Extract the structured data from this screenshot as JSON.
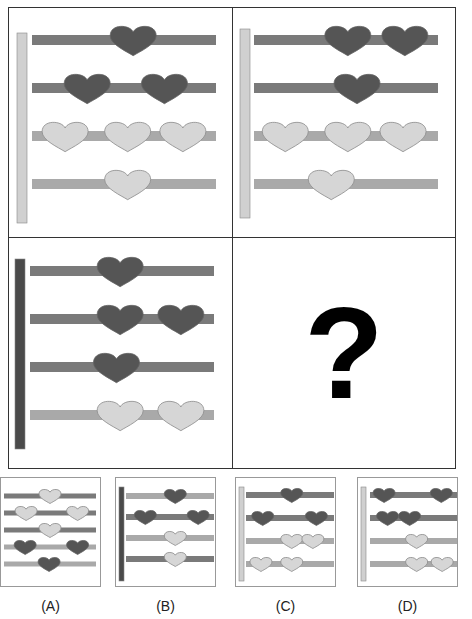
{
  "colors": {
    "dark": "#555555",
    "dark_bar": "#7a7a7a",
    "light": "#d6d6d6",
    "light_bar": "#a9a9a9",
    "light_stroke": "#8a8a8a",
    "dark_pole": "#4a4a4a",
    "light_pole": "#d0d0d0"
  },
  "puzzle": {
    "cells": [
      {
        "name": "cell-top-left",
        "pole": "light",
        "rows": [
          {
            "bar": "dark",
            "hearts": [
              {
                "c": "dark",
                "x": 0.55
              }
            ]
          },
          {
            "bar": "dark",
            "hearts": [
              {
                "c": "dark",
                "x": 0.3
              },
              {
                "c": "dark",
                "x": 0.72
              }
            ]
          },
          {
            "bar": "light",
            "hearts": [
              {
                "c": "light",
                "x": 0.18
              },
              {
                "c": "light",
                "x": 0.52
              },
              {
                "c": "light",
                "x": 0.82
              }
            ]
          },
          {
            "bar": "light",
            "hearts": [
              {
                "c": "light",
                "x": 0.52
              }
            ]
          }
        ]
      },
      {
        "name": "cell-top-right",
        "pole": "light",
        "rows": [
          {
            "bar": "dark",
            "hearts": [
              {
                "c": "dark",
                "x": 0.51
              },
              {
                "c": "dark",
                "x": 0.82
              }
            ]
          },
          {
            "bar": "dark",
            "hearts": [
              {
                "c": "dark",
                "x": 0.56
              }
            ]
          },
          {
            "bar": "light",
            "hearts": [
              {
                "c": "light",
                "x": 0.17
              },
              {
                "c": "light",
                "x": 0.51
              },
              {
                "c": "light",
                "x": 0.81
              }
            ]
          },
          {
            "bar": "light",
            "hearts": [
              {
                "c": "light",
                "x": 0.42
              }
            ]
          }
        ]
      },
      {
        "name": "cell-bottom-left",
        "pole": "dark",
        "rows": [
          {
            "bar": "dark",
            "hearts": [
              {
                "c": "dark",
                "x": 0.49
              }
            ]
          },
          {
            "bar": "dark",
            "hearts": [
              {
                "c": "dark",
                "x": 0.49
              },
              {
                "c": "dark",
                "x": 0.82
              }
            ]
          },
          {
            "bar": "dark",
            "hearts": [
              {
                "c": "dark",
                "x": 0.47
              }
            ]
          },
          {
            "bar": "light",
            "hearts": [
              {
                "c": "light",
                "x": 0.49
              },
              {
                "c": "light",
                "x": 0.82
              }
            ]
          }
        ]
      }
    ],
    "question_mark": "?"
  },
  "options": [
    {
      "label": "(A)",
      "pole": null,
      "rows": [
        {
          "bar": "dark",
          "hearts": [
            {
              "c": "light",
              "x": 0.5
            }
          ]
        },
        {
          "bar": "dark",
          "hearts": [
            {
              "c": "light",
              "x": 0.24
            },
            {
              "c": "light",
              "x": 0.8
            }
          ]
        },
        {
          "bar": "dark",
          "hearts": [
            {
              "c": "light",
              "x": 0.5
            }
          ]
        },
        {
          "bar": "light",
          "hearts": [
            {
              "c": "dark",
              "x": 0.23
            },
            {
              "c": "dark",
              "x": 0.8
            }
          ]
        },
        {
          "bar": "light",
          "hearts": [
            {
              "c": "dark",
              "x": 0.49
            }
          ]
        }
      ]
    },
    {
      "label": "(B)",
      "pole": "dark",
      "rows": [
        {
          "bar": "light",
          "hearts": [
            {
              "c": "dark",
              "x": 0.56
            }
          ]
        },
        {
          "bar": "dark",
          "hearts": [
            {
              "c": "dark",
              "x": 0.22
            },
            {
              "c": "dark",
              "x": 0.82
            }
          ]
        },
        {
          "bar": "light",
          "hearts": [
            {
              "c": "light",
              "x": 0.56
            }
          ]
        },
        {
          "bar": "dark",
          "hearts": [
            {
              "c": "light",
              "x": 0.56
            }
          ]
        }
      ]
    },
    {
      "label": "(C)",
      "pole": "light",
      "rows": [
        {
          "bar": "dark",
          "hearts": [
            {
              "c": "dark",
              "x": 0.52
            }
          ]
        },
        {
          "bar": "dark",
          "hearts": [
            {
              "c": "dark",
              "x": 0.19
            },
            {
              "c": "dark",
              "x": 0.8
            }
          ]
        },
        {
          "bar": "light",
          "hearts": [
            {
              "c": "light",
              "x": 0.52
            },
            {
              "c": "light",
              "x": 0.76
            }
          ]
        },
        {
          "bar": "light",
          "hearts": [
            {
              "c": "light",
              "x": 0.17
            },
            {
              "c": "light",
              "x": 0.52
            }
          ]
        }
      ]
    },
    {
      "label": "(D)",
      "pole": "light",
      "rows": [
        {
          "bar": "dark",
          "hearts": [
            {
              "c": "dark",
              "x": 0.16
            },
            {
              "c": "dark",
              "x": 0.81
            }
          ]
        },
        {
          "bar": "dark",
          "hearts": [
            {
              "c": "dark",
              "x": 0.2
            },
            {
              "c": "dark",
              "x": 0.45
            }
          ]
        },
        {
          "bar": "light",
          "hearts": [
            {
              "c": "light",
              "x": 0.53
            }
          ]
        },
        {
          "bar": "light",
          "hearts": [
            {
              "c": "light",
              "x": 0.53
            },
            {
              "c": "light",
              "x": 0.82
            }
          ]
        }
      ]
    }
  ]
}
